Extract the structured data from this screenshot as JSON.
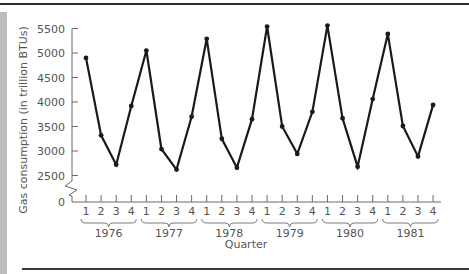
{
  "chart_data": {
    "type": "line",
    "title": "",
    "xlabel": "Quarter",
    "ylabel": "Gas consumption (in trillion BTUs)",
    "ylim": [
      0,
      5500
    ],
    "y_axis_break": {
      "from": 0,
      "to": 2500
    },
    "yticks": [
      0,
      2500,
      3000,
      3500,
      4000,
      4500,
      5000,
      5500
    ],
    "ytick_labels": [
      "0",
      "2500",
      "3000",
      "3500",
      "4000",
      "4500",
      "5000",
      "5500"
    ],
    "grid": false,
    "legend": null,
    "years": [
      "1976",
      "1977",
      "1978",
      "1979",
      "1980",
      "1981"
    ],
    "quarter_labels": [
      "1",
      "2",
      "3",
      "4"
    ],
    "categories": [
      "1976 Q1",
      "1976 Q2",
      "1976 Q3",
      "1976 Q4",
      "1977 Q1",
      "1977 Q2",
      "1977 Q3",
      "1977 Q4",
      "1978 Q1",
      "1978 Q2",
      "1978 Q3",
      "1978 Q4",
      "1979 Q1",
      "1979 Q2",
      "1979 Q3",
      "1979 Q4",
      "1980 Q1",
      "1980 Q2",
      "1980 Q3",
      "1980 Q4",
      "1981 Q1",
      "1981 Q2",
      "1981 Q3",
      "1981 Q4"
    ],
    "series": [
      {
        "name": "Gas consumption",
        "color": "#1a1a1a",
        "marker": "circle",
        "values": [
          4900,
          3320,
          2720,
          3920,
          5050,
          3040,
          2620,
          3700,
          5290,
          3250,
          2660,
          3650,
          5540,
          3500,
          2940,
          3800,
          5560,
          3670,
          2680,
          4060,
          5390,
          3510,
          2890,
          3940
        ]
      }
    ]
  }
}
